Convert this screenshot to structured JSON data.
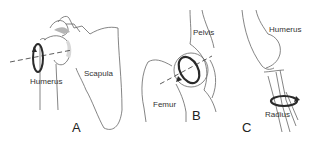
{
  "diagram": {
    "panels": [
      {
        "letter": "A",
        "labels": {
          "bone1": "Humerus",
          "bone2": "Scapula"
        }
      },
      {
        "letter": "B",
        "labels": {
          "bone1": "Pelvis",
          "bone2": "Femur"
        }
      },
      {
        "letter": "C",
        "labels": {
          "bone1": "Humerus",
          "bone2": "Radius"
        }
      }
    ],
    "colors": {
      "stroke": "#555555",
      "arrow": "#2a2a2a",
      "shade": "#b5b5b5"
    }
  }
}
